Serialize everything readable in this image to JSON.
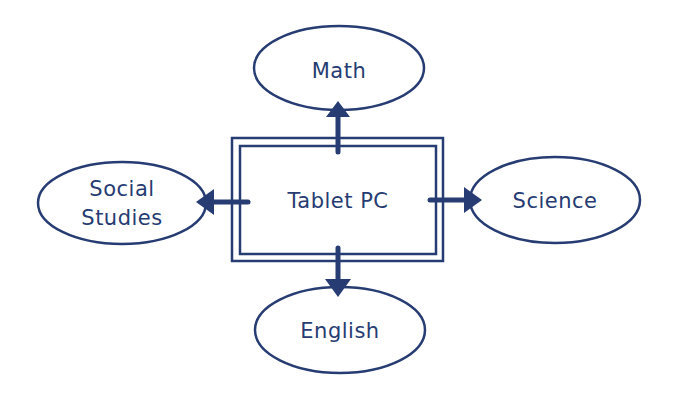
{
  "diagram": {
    "center": {
      "label": "Tablet PC"
    },
    "nodes": [
      {
        "id": "math",
        "label": "Math"
      },
      {
        "id": "social-studies",
        "label_line1": "Social",
        "label_line2": "Studies"
      },
      {
        "id": "science",
        "label": "Science"
      },
      {
        "id": "english",
        "label": "English"
      }
    ],
    "edges": [
      {
        "from": "Tablet PC",
        "to": "Math",
        "direction": "up"
      },
      {
        "from": "Tablet PC",
        "to": "Social Studies",
        "direction": "left"
      },
      {
        "from": "Tablet PC",
        "to": "Science",
        "direction": "right"
      },
      {
        "from": "Tablet PC",
        "to": "English",
        "direction": "down"
      }
    ],
    "colors": {
      "stroke": "#263c72",
      "text": "#263c72",
      "background": "#ffffff"
    }
  }
}
